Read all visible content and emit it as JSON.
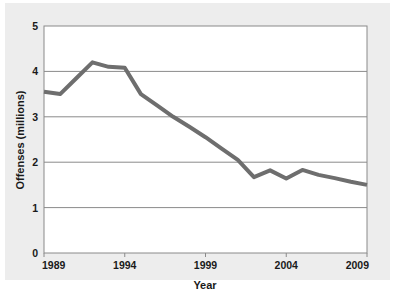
{
  "figure": {
    "background_color": "#ededed",
    "plot_background_color": "#ffffff",
    "border_color": "#8a8a8a",
    "grid_color": "#8a8a8a",
    "line_color": "#6e6e6e",
    "text_color": "#1a1a1a"
  },
  "chart_data": {
    "type": "line",
    "title": "",
    "xlabel": "Year",
    "ylabel": "Offenses (millions)",
    "xlim": [
      1989,
      2009
    ],
    "ylim": [
      0,
      5
    ],
    "xticks": [
      1989,
      1994,
      1999,
      2004,
      2009
    ],
    "xtick_labels": [
      "1989",
      "1994",
      "1999",
      "2004",
      "2009"
    ],
    "yticks": [
      0,
      1,
      2,
      3,
      4,
      5
    ],
    "ytick_labels": [
      "0",
      "1",
      "2",
      "3",
      "4",
      "5"
    ],
    "grid": "horizontal",
    "legend": "none",
    "x": [
      1989,
      1990,
      1991,
      1992,
      1993,
      1994,
      1995,
      1996,
      1997,
      1998,
      1999,
      2000,
      2001,
      2002,
      2003,
      2004,
      2005,
      2006,
      2007,
      2008,
      2009
    ],
    "series": [
      {
        "name": "Offenses",
        "values": [
          3.55,
          3.5,
          3.85,
          4.2,
          4.1,
          4.08,
          3.5,
          3.25,
          3.0,
          2.78,
          2.55,
          2.3,
          2.05,
          1.67,
          1.82,
          1.64,
          1.83,
          1.72,
          1.65,
          1.57,
          1.5
        ]
      }
    ]
  }
}
